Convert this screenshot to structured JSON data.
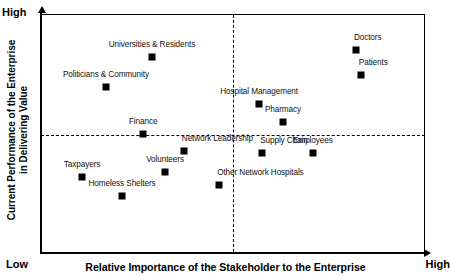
{
  "chart_data": {
    "type": "scatter",
    "title": "",
    "xlabel": "Relative Importance of the Stakeholder to the Enterprise",
    "ylabel": "Current Performance of the Enterprise in Delivering Value",
    "ylabel_line1": "Current Performance of the Enterprise",
    "ylabel_line2": "in Delivering Value",
    "x_axis_low_label": "Low",
    "x_axis_high_label": "High",
    "y_axis_high_label": "High",
    "xlim": [
      0,
      100
    ],
    "ylim": [
      0,
      100
    ],
    "grid": false,
    "legend": "none",
    "quadrant_divider_x": 50,
    "quadrant_divider_y": 50,
    "marker_color": "#000000",
    "frame_color": "#000000",
    "points": [
      {
        "label": "Universities & Residents",
        "x": 28.9,
        "y": 82.0,
        "label_pos": "above-center"
      },
      {
        "label": "Politicians & Community",
        "x": 16.9,
        "y": 69.5,
        "label_pos": "above-center"
      },
      {
        "label": "Doctors",
        "x": 82.0,
        "y": 85.0,
        "label_pos": "above-left"
      },
      {
        "label": "Patients",
        "x": 83.3,
        "y": 74.5,
        "label_pos": "above-left"
      },
      {
        "label": "Hospital Management",
        "x": 56.8,
        "y": 62.5,
        "label_pos": "above-center"
      },
      {
        "label": "Pharmacy",
        "x": 63.0,
        "y": 55.0,
        "label_pos": "above-center"
      },
      {
        "label": "Finance",
        "x": 26.6,
        "y": 50.0,
        "label_pos": "above-center"
      },
      {
        "label": "Network Leadership",
        "x": 37.2,
        "y": 42.5,
        "label_pos": "above-left"
      },
      {
        "label": "Supply Chain",
        "x": 57.6,
        "y": 42.0,
        "label_pos": "above-left"
      },
      {
        "label": "Employees",
        "x": 70.8,
        "y": 42.0,
        "label_pos": "above-center"
      },
      {
        "label": "Volunteers",
        "x": 32.3,
        "y": 34.0,
        "label_pos": "above-center"
      },
      {
        "label": "Other Network Hospitals",
        "x": 46.4,
        "y": 28.5,
        "label_pos": "above-left"
      },
      {
        "label": "Taxpayers",
        "x": 10.7,
        "y": 32.0,
        "label_pos": "above-center"
      },
      {
        "label": "Homeless Shelters",
        "x": 21.1,
        "y": 24.0,
        "label_pos": "above-center"
      }
    ]
  }
}
